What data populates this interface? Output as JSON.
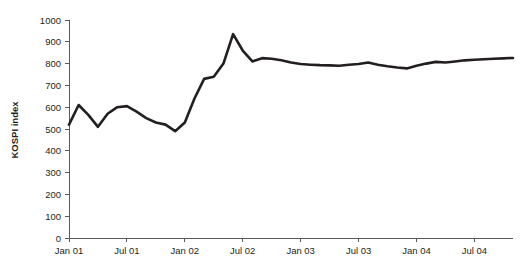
{
  "chart_data": {
    "type": "line",
    "title": "",
    "subtitle": "",
    "xlabel": "",
    "ylabel": "KOSPI index",
    "ylim": [
      0,
      1000
    ],
    "y_ticks": [
      0,
      100,
      200,
      300,
      400,
      500,
      600,
      700,
      800,
      900,
      1000
    ],
    "y_tick_labels": [
      "0",
      "100",
      "200",
      "300",
      "400",
      "500",
      "600",
      "700",
      "800",
      "900",
      "1000"
    ],
    "x_tick_labels": [
      "Jan 01",
      "Jul 01",
      "Jan 02",
      "Jul 02",
      "Jan 03",
      "Jul 03",
      "Jan 04",
      "Jul 04"
    ],
    "x_tick_months": [
      0,
      6,
      12,
      18,
      24,
      30,
      36,
      42
    ],
    "xlim_months": [
      0,
      46
    ],
    "grid": false,
    "legend": false,
    "legend_position": "none",
    "line_color": "#231f20",
    "axis_color": "#58595b",
    "background_color": "#ffffff",
    "series": [
      {
        "name": "KOSPI index",
        "x_months": [
          0,
          1,
          2,
          3,
          4,
          5,
          6,
          7,
          8,
          9,
          10,
          11,
          12,
          13,
          14,
          15,
          16,
          17,
          18,
          19,
          20,
          21,
          22,
          23,
          24,
          25,
          26,
          27,
          28,
          29,
          30,
          31,
          32,
          33,
          34,
          35,
          36,
          37,
          38,
          39,
          40,
          41,
          42,
          43,
          44,
          45,
          46
        ],
        "x_labels": [
          "Jan 01",
          "Feb 01",
          "Mar 01",
          "Apr 01",
          "May 01",
          "Jun 01",
          "Jul 01",
          "Aug 01",
          "Sep 01",
          "Oct 01",
          "Nov 01",
          "Dec 01",
          "Jan 02",
          "Feb 02",
          "Mar 02",
          "Apr 02",
          "May 02",
          "Jun 02",
          "Jul 02",
          "Aug 02",
          "Sep 02",
          "Oct 02",
          "Nov 02",
          "Dec 02",
          "Jan 03",
          "Feb 03",
          "Mar 03",
          "Apr 03",
          "May 03",
          "Jun 03",
          "Jul 03",
          "Aug 03",
          "Sep 03",
          "Oct 03",
          "Nov 03",
          "Dec 03",
          "Jan 04",
          "Feb 04",
          "Mar 04",
          "Apr 04",
          "May 04",
          "Jun 04",
          "Jul 04",
          "Aug 04",
          "Sep 04",
          "Oct 04",
          "Nov 04"
        ],
        "values": [
          520,
          610,
          565,
          510,
          570,
          600,
          605,
          580,
          550,
          530,
          520,
          490,
          530,
          640,
          730,
          740,
          800,
          935,
          860,
          810,
          825,
          822,
          815,
          805,
          798,
          795,
          793,
          792,
          790,
          795,
          798,
          805,
          795,
          788,
          782,
          778,
          790,
          800,
          808,
          805,
          810,
          815,
          818,
          820,
          822,
          824,
          826
        ]
      }
    ]
  },
  "axis_titles": {
    "y": "KOSPI index"
  }
}
